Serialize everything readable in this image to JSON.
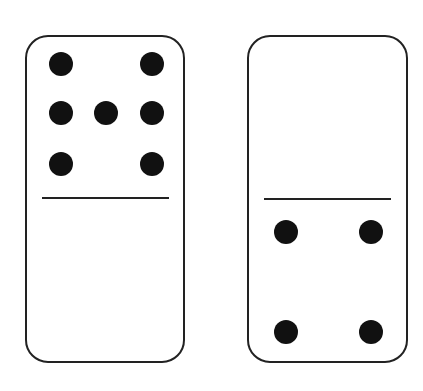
{
  "figure": {
    "colors": {
      "background": "#ffffff",
      "outline": "#222222",
      "pip": "#111111"
    }
  },
  "dominoes": [
    {
      "label": "domino-left",
      "top_value": 7,
      "bottom_value": 0,
      "rect": {
        "x": 26,
        "y": 36,
        "w": 158,
        "h": 326,
        "r": 22
      },
      "divider": {
        "x1": 42,
        "x2": 169,
        "y": 198
      },
      "pips": [
        [
          61,
          64
        ],
        [
          152,
          64
        ],
        [
          61,
          113
        ],
        [
          106,
          113
        ],
        [
          152,
          113
        ],
        [
          61,
          164
        ],
        [
          152,
          164
        ]
      ]
    },
    {
      "label": "domino-right",
      "top_value": 0,
      "bottom_value": 4,
      "rect": {
        "x": 248,
        "y": 36,
        "w": 159,
        "h": 326,
        "r": 22
      },
      "divider": {
        "x1": 264,
        "x2": 391,
        "y": 199
      },
      "pips": [
        [
          286,
          232
        ],
        [
          371,
          232
        ],
        [
          286,
          332
        ],
        [
          371,
          332
        ]
      ]
    }
  ],
  "pip_radius": 12
}
